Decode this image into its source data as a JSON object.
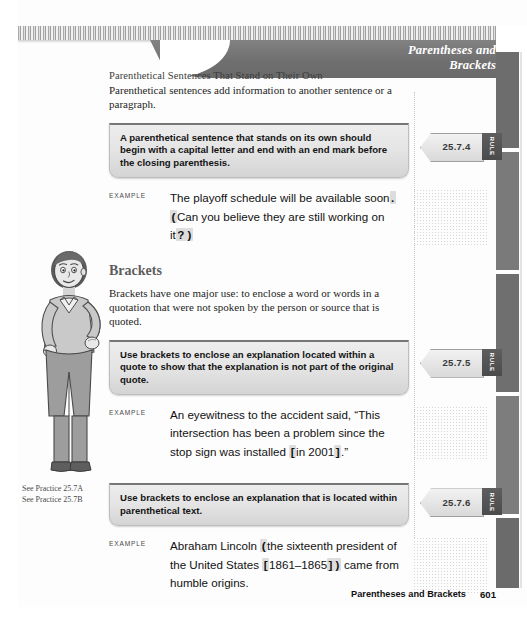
{
  "header": {
    "banner_title_line1": "Parentheses and",
    "banner_title_line2": "Brackets"
  },
  "section": {
    "subhead": "Parenthetical Sentences That Stand on Their Own",
    "intro": "Parenthetical sentences add information to another sentence or a paragraph.",
    "brackets_heading": "Brackets",
    "brackets_intro": "Brackets have one major use: to enclose a word or words in a quotation that were not spoken by the person or source that is quoted."
  },
  "rules": [
    {
      "number": "25.7.4",
      "badge": "RULE",
      "text_lead": "A ",
      "text_bold": "parenthetical sentence",
      "text_rest": " that stands on its own should begin with a capital letter and end with an end mark before the closing parenthesis."
    },
    {
      "number": "25.7.5",
      "badge": "RULE",
      "text_lead": "Use ",
      "text_bold": "brackets",
      "text_rest": " to enclose an explanation located within a quote to show that the explanation is not part of the original quote."
    },
    {
      "number": "25.7.6",
      "badge": "RULE",
      "text_lead": "Use ",
      "text_bold": "brackets",
      "text_rest": " to enclose an explanation that is located within parenthetical text."
    }
  ],
  "examples": [
    {
      "label": "EXAMPLE",
      "parts": [
        {
          "t": "The playoff schedule will be available soon",
          "mark": false
        },
        {
          "t": ".",
          "mark": true
        },
        {
          "t": " ",
          "mark": false
        },
        {
          "t": "(",
          "mark": true
        },
        {
          "t": "Can you believe they are still working on it",
          "mark": false
        },
        {
          "t": "?",
          "mark": true
        },
        {
          "t": ")",
          "mark": true
        }
      ]
    },
    {
      "label": "EXAMPLE",
      "parts": [
        {
          "t": "An eyewitness to the accident said, “This intersection has been a problem since the stop sign was installed ",
          "mark": false
        },
        {
          "t": "[",
          "mark": true
        },
        {
          "t": "in 2001",
          "mark": false
        },
        {
          "t": "]",
          "mark": true
        },
        {
          "t": ".”",
          "mark": false
        }
      ]
    },
    {
      "label": "EXAMPLE",
      "parts": [
        {
          "t": "Abraham Lincoln ",
          "mark": false
        },
        {
          "t": "(",
          "mark": true
        },
        {
          "t": "the sixteenth president of the United States ",
          "mark": false
        },
        {
          "t": "[",
          "mark": true
        },
        {
          "t": "1861–1865",
          "mark": false
        },
        {
          "t": "]",
          "mark": true
        },
        {
          "t": ")",
          "mark": true
        },
        {
          "t": " came from humble origins.",
          "mark": false
        }
      ]
    }
  ],
  "practice": {
    "line1": "See Practice 25.7A",
    "line2": "See Practice 25.7B"
  },
  "footer": {
    "title": "Parentheses and Brackets",
    "page": "601"
  },
  "colors": {
    "banner": "#6f6f6f",
    "rule_box": "#e4e4e4",
    "highlight": "#dddddd",
    "heading": "#5d5d5d"
  }
}
